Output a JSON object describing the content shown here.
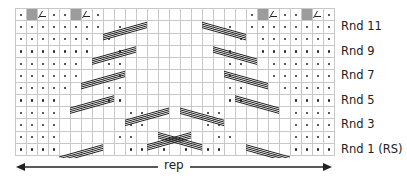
{
  "chart": {
    "columns": 29,
    "rows_top_to_bottom": [
      ".g/..g/.             .g/..g/.",
      "........ .         . ........",
      "....... .           . .......",
      ".......  .         .  .......",
      "......  ..         ..  ......",
      "......   .         .   ......",
      ".....   ..         ..   .....",
      "....    ..         ..    ....",
      "....      ..     ..      ....",
      "....      ..     ..      ....",
      "....     ..       ..     ....",
      "....      .. . . ..      ...."
    ],
    "legend": {
      ".": "purl",
      " ": "knit",
      "g": "no stitch",
      "/": "decrease"
    }
  },
  "round_labels": [
    {
      "label": "Rnd 11",
      "row": 1
    },
    {
      "label": "Rnd 9",
      "row": 3
    },
    {
      "label": "Rnd 7",
      "row": 5
    },
    {
      "label": "Rnd 5",
      "row": 7
    },
    {
      "label": "Rnd 3",
      "row": 9
    },
    {
      "label": "Rnd 1 (RS)",
      "row": 11
    }
  ],
  "repeat": {
    "label": "rep"
  },
  "colors": {
    "grid": "#c8c8c8",
    "no_stitch": "#9c9c9c",
    "ink": "#222222"
  }
}
